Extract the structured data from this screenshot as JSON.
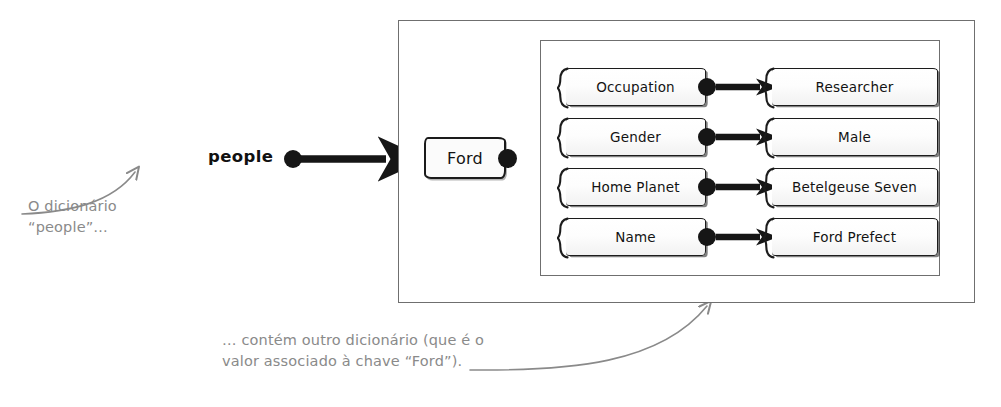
{
  "diagram": {
    "title_variable": "people",
    "key_node": {
      "label": "Ford",
      "shape": "rounded-rectangle"
    },
    "pairs": [
      {
        "key": "Occupation",
        "value": "Researcher"
      },
      {
        "key": "Gender",
        "value": "Male"
      },
      {
        "key": "Home Planet",
        "value": "Betelgeuse Seven"
      },
      {
        "key": "Name",
        "value": "Ford Prefect"
      }
    ],
    "annotations": {
      "left": "O dicionário\n“people”…",
      "bottom": "… contém outro dicionário (que é o\nvalor associado à chave “Ford”)."
    },
    "colors": {
      "ink": "#161616",
      "frame": "#6f6f6f",
      "annotation": "#8a8a8a",
      "paper": "#ffffff"
    }
  }
}
